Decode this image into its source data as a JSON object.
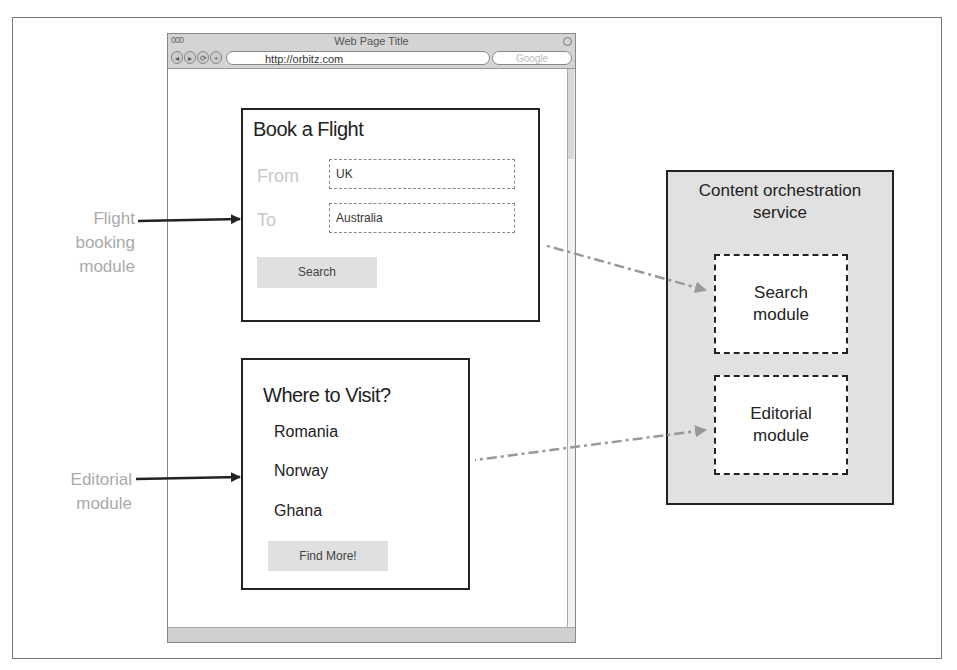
{
  "browser": {
    "window_title": "Web Page Title",
    "traffic_lights": "000",
    "nav_buttons": [
      "◂",
      "▸",
      "⟳",
      "+"
    ],
    "url": "http://orbitz.com",
    "search_placeholder": "Google"
  },
  "flight_module": {
    "title": "Book a Flight",
    "from_label": "From",
    "from_value": "UK",
    "to_label": "To",
    "to_value": "Australia",
    "search_button": "Search"
  },
  "editorial_module": {
    "title": "Where to Visit?",
    "countries": [
      "Romania",
      "Norway",
      "Ghana"
    ],
    "find_more_button": "Find More!"
  },
  "labels": {
    "flight_line1": "Flight",
    "flight_line2": "booking",
    "flight_line3": "module",
    "editorial_line1": "Editorial",
    "editorial_line2": "module"
  },
  "orchestration": {
    "title_line1": "Content orchestration",
    "title_line2": "service",
    "search_line1": "Search",
    "search_line2": "module",
    "editorial_line1": "Editorial",
    "editorial_line2": "module"
  },
  "colors": {
    "border": "#222222",
    "label_gray": "#aaaaaa",
    "service_fill": "#e1e1e1",
    "button_fill": "#e0e0e0",
    "dashed_arrow": "#999999"
  }
}
